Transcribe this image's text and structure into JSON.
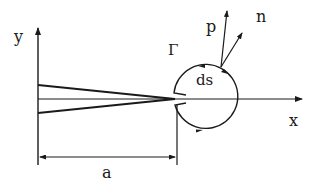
{
  "diagram": {
    "labels": {
      "y_axis": "y",
      "x_axis": "x",
      "contour": "Γ",
      "element": "ds",
      "traction": "p",
      "normal": "n",
      "crack_length": "a"
    },
    "colors": {
      "ink": "#1a1a1a",
      "background": "#ffffff"
    }
  }
}
